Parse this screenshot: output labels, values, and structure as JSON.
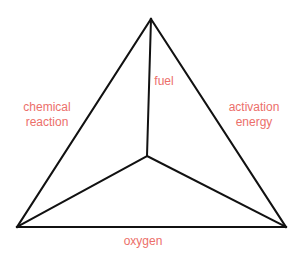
{
  "diagram": {
    "type": "tetrahedron",
    "title": "",
    "line_color": "#111111",
    "label_color": "#ec6f6a",
    "vertices": {
      "apex": [
        151,
        19
      ],
      "bottom_left": [
        17,
        227
      ],
      "bottom_right": [
        286,
        227
      ],
      "center": [
        147,
        156
      ]
    },
    "labels": {
      "fuel": "fuel",
      "chemical_reaction_line1": "chemical",
      "chemical_reaction_line2": "reaction",
      "activation_energy_line1": "activation",
      "activation_energy_line2": "energy",
      "oxygen": "oxygen"
    }
  }
}
